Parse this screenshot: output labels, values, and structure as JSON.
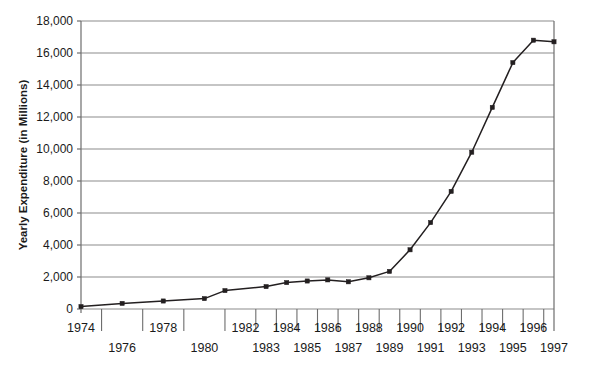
{
  "chart_data": {
    "type": "line",
    "title": "",
    "xlabel": "",
    "ylabel": "Yearly Expenditure (in Millions)",
    "x": [
      1974,
      1976,
      1978,
      1980,
      1981,
      1983,
      1984,
      1985,
      1986,
      1987,
      1988,
      1989,
      1990,
      1991,
      1992,
      1993,
      1994,
      1995,
      1996,
      1997
    ],
    "values": [
      150,
      350,
      500,
      650,
      1150,
      1400,
      1650,
      1750,
      1820,
      1700,
      1950,
      2350,
      3700,
      5400,
      7350,
      9800,
      12600,
      15400,
      16800,
      16700
    ],
    "series": [
      {
        "name": "Yearly Expenditure",
        "values": [
          150,
          350,
          500,
          650,
          1150,
          1400,
          1650,
          1750,
          1820,
          1700,
          1950,
          2350,
          3700,
          5400,
          7350,
          9800,
          12600,
          15400,
          16800,
          16700
        ]
      }
    ],
    "ylim": [
      0,
      18000
    ],
    "xlim": [
      1974,
      1997
    ],
    "y_ticks": [
      0,
      2000,
      4000,
      6000,
      8000,
      10000,
      12000,
      14000,
      16000,
      18000
    ],
    "y_tick_labels": [
      "0",
      "2,000",
      "4,000",
      "6,000",
      "8,000",
      "10,000",
      "12,000",
      "14,000",
      "16,000",
      "18,000"
    ],
    "x_tick_labels_top": [
      "1974",
      "1978",
      "1982",
      "1984",
      "1986",
      "1988",
      "1990",
      "1992",
      "1994",
      "1996"
    ],
    "x_tick_labels_bottom": [
      "1976",
      "1980",
      "1983",
      "1985",
      "1987",
      "1989",
      "1991",
      "1993",
      "1995",
      "1997"
    ],
    "x_tick_values_top": [
      1974,
      1978,
      1982,
      1984,
      1986,
      1988,
      1990,
      1992,
      1994,
      1996
    ],
    "x_tick_values_bottom": [
      1976,
      1980,
      1983,
      1985,
      1987,
      1989,
      1991,
      1993,
      1995,
      1997
    ],
    "grid": true,
    "grid_axis": "y",
    "legend": false,
    "legend_position": "none",
    "marker": "square",
    "line_color": "#231f20",
    "marker_color": "#231f20",
    "grid_color": "#8c8c8c",
    "axis_color": "#6d6d6d",
    "background": "#ffffff"
  }
}
